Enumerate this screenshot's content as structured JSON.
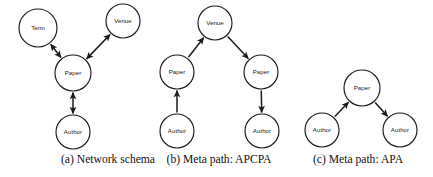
{
  "figure": {
    "type": "diagram",
    "background_color": "#ffffff",
    "stroke_color": "#1a1a1a",
    "panels": [
      {
        "id": "a",
        "caption": "(a) Network schema",
        "caption_x": 108,
        "caption_y": 160,
        "nodes": [
          {
            "id": "a-term",
            "label": "Term",
            "cx": 38,
            "cy": 28,
            "r": 19
          },
          {
            "id": "a-venue",
            "label": "Venue",
            "cx": 123,
            "cy": 21,
            "r": 17
          },
          {
            "id": "a-paper",
            "label": "Paper",
            "cx": 73,
            "cy": 73,
            "r": 18
          },
          {
            "id": "a-author",
            "label": "Author",
            "cx": 73,
            "cy": 132,
            "r": 17
          }
        ],
        "edges": [
          {
            "id": "a-term-paper",
            "from": "a-paper",
            "to": "a-term",
            "arrow": "both"
          },
          {
            "id": "a-venue-paper",
            "from": "a-paper",
            "to": "a-venue",
            "arrow": "both"
          },
          {
            "id": "a-paper-author",
            "from": "a-author",
            "to": "a-paper",
            "arrow": "both"
          }
        ]
      },
      {
        "id": "b",
        "caption": "(b) Meta path: APCPA",
        "caption_x": 219,
        "caption_y": 160,
        "nodes": [
          {
            "id": "b-venue",
            "label": "Venue",
            "cx": 215,
            "cy": 23,
            "r": 17
          },
          {
            "id": "b-paper-l",
            "label": "Paper",
            "cx": 177,
            "cy": 72,
            "r": 17
          },
          {
            "id": "b-paper-r",
            "label": "Paper",
            "cx": 261,
            "cy": 72,
            "r": 17
          },
          {
            "id": "b-author-l",
            "label": "Author",
            "cx": 177,
            "cy": 131,
            "r": 17
          },
          {
            "id": "b-author-r",
            "label": "Author",
            "cx": 262,
            "cy": 131,
            "r": 17
          }
        ],
        "edges": [
          {
            "id": "b-author-l-paper-l",
            "from": "b-author-l",
            "to": "b-paper-l",
            "arrow": "end"
          },
          {
            "id": "b-paper-l-venue",
            "from": "b-paper-l",
            "to": "b-venue",
            "arrow": "end"
          },
          {
            "id": "b-venue-paper-r",
            "from": "b-venue",
            "to": "b-paper-r",
            "arrow": "end"
          },
          {
            "id": "b-paper-r-author-r",
            "from": "b-paper-r",
            "to": "b-author-r",
            "arrow": "end"
          }
        ]
      },
      {
        "id": "c",
        "caption": "(c) Meta path: APA",
        "caption_x": 358,
        "caption_y": 160,
        "nodes": [
          {
            "id": "c-paper",
            "label": "Paper",
            "cx": 362,
            "cy": 88,
            "r": 18
          },
          {
            "id": "c-author-l",
            "label": "Author",
            "cx": 322,
            "cy": 130,
            "r": 17
          },
          {
            "id": "c-author-r",
            "label": "Author",
            "cx": 400,
            "cy": 130,
            "r": 17
          }
        ],
        "edges": [
          {
            "id": "c-author-l-paper",
            "from": "c-author-l",
            "to": "c-paper",
            "arrow": "end"
          },
          {
            "id": "c-paper-author-r",
            "from": "c-paper",
            "to": "c-author-r",
            "arrow": "end"
          }
        ]
      }
    ]
  }
}
